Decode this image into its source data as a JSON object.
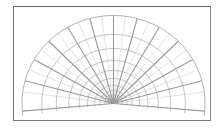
{
  "diagram": {
    "type": "polar-grid-semicircle",
    "frame": {
      "x": 13,
      "y": 6,
      "width": 198,
      "height": 115,
      "color": "#6e6e6e"
    },
    "center": {
      "x": 113.5,
      "y": 103.5
    },
    "scale_x": 1.04,
    "ring_radii": [
      88,
      69,
      55,
      43,
      33,
      25,
      18,
      13,
      8.5,
      4.5
    ],
    "ray_angles_deg": [
      -5,
      15,
      30,
      45,
      60,
      75,
      90,
      105,
      120,
      135,
      150,
      165,
      185
    ],
    "minor_ray_angles_deg": [
      7.5,
      22.5,
      37.5,
      52.5,
      67.5,
      82.5,
      97.5,
      112.5,
      127.5,
      142.5,
      157.5,
      172.5
    ],
    "arc_start_deg": -8,
    "arc_end_deg": 188,
    "ring_color": "#a8a8a8",
    "ray_color": "#9a9a9a",
    "minor_ray_color": "#c4c4c4"
  }
}
